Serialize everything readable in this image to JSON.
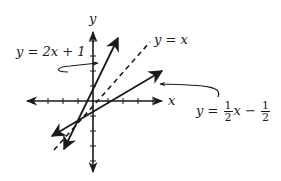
{
  "diagram": {
    "type": "coordinate-plane-graph",
    "axes": {
      "x_label": "x",
      "y_label": "y",
      "x_ticks_each_side": 4,
      "y_ticks_each_side": 4
    },
    "lines": [
      {
        "id": "line-2x-plus-1",
        "equation": "y = 2x + 1",
        "label_parts": {
          "lhs": "y",
          "eq": " = ",
          "rhs": "2x + 1"
        },
        "style": "solid",
        "slope": 2,
        "intercept": 1
      },
      {
        "id": "line-identity",
        "equation": "y = x",
        "label_parts": {
          "lhs": "y",
          "eq": " = ",
          "rhs": "x"
        },
        "style": "dashed",
        "slope": 1,
        "intercept": 0
      },
      {
        "id": "line-half-x-minus-half",
        "equation": "y = 1/2 x − 1/2",
        "label_parts": {
          "lhs": "y",
          "eq": " = ",
          "frac1_num": "1",
          "frac1_den": "2",
          "var": "x",
          "minus": " − ",
          "frac2_num": "1",
          "frac2_den": "2"
        },
        "style": "solid",
        "slope": 0.5,
        "intercept": -0.5
      }
    ],
    "colors": {
      "ink": "#1a1a1a",
      "background": "#ffffff"
    }
  }
}
